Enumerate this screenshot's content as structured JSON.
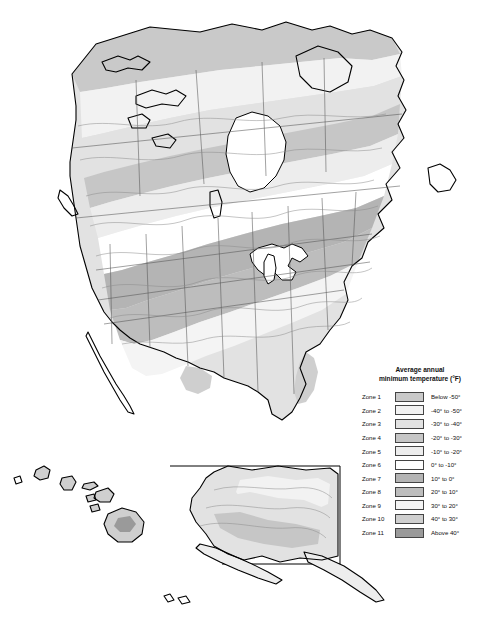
{
  "map": {
    "kind": "plant-hardiness-zone-map",
    "region": "North America",
    "background_color": "#ffffff",
    "coastline_color": "#000000",
    "state_border_color": "#555555",
    "zone_contour_color": "#8a8a8a",
    "insets": [
      "Alaska",
      "Hawaii"
    ]
  },
  "legend": {
    "title_line1": "Average annual",
    "title_line2": "minimum temperature (°F)",
    "rows": [
      {
        "zone": "Zone 1",
        "range": "Below -50°",
        "color": "#c9c9c9"
      },
      {
        "zone": "Zone 2",
        "range": "-40° to -50°",
        "color": "#f2f2f2"
      },
      {
        "zone": "Zone 3",
        "range": "-30° to -40°",
        "color": "#e2e2e2"
      },
      {
        "zone": "Zone 4",
        "range": "-20° to -30°",
        "color": "#c6c6c6"
      },
      {
        "zone": "Zone 5",
        "range": "-10° to -20°",
        "color": "#ededed"
      },
      {
        "zone": "Zone 6",
        "range": "0° to -10°",
        "color": "#ffffff"
      },
      {
        "zone": "Zone 7",
        "range": "10° to 0°",
        "color": "#b4b4b4"
      },
      {
        "zone": "Zone 8",
        "range": "20° to 10°",
        "color": "#bdbdbd"
      },
      {
        "zone": "Zone 9",
        "range": "30° to 20°",
        "color": "#f4f4f4"
      },
      {
        "zone": "Zone 10",
        "range": "40° to 30°",
        "color": "#cfcfcf"
      },
      {
        "zone": "Zone 11",
        "range": "Above 40°",
        "color": "#9a9a9a"
      }
    ]
  }
}
